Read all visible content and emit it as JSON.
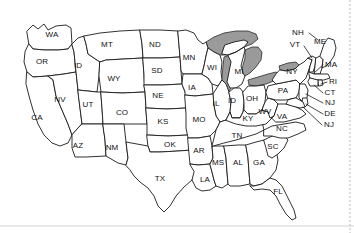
{
  "figure": {
    "width": 354,
    "height": 233,
    "background_color": "#ffffff",
    "outline_color": "#1a1a1a",
    "lake_fill_color": "#9a9a9a",
    "label_color": "#111111"
  },
  "map_data": {
    "type": "choropleth-outline",
    "projection": "albers-usa-like",
    "region": "contiguous United States",
    "state_count": 49,
    "features_shown": [
      "state outlines",
      "state abbreviation labels",
      "Great Lakes shaded gray",
      "leader lines for small northeastern states"
    ],
    "features_absent": [
      "Alaska",
      "Hawaii",
      "legend",
      "scale bar",
      "north arrow",
      "title text"
    ],
    "labels": [
      {
        "id": "WA",
        "text": "WA",
        "x": 52,
        "y": 35,
        "size": "normal"
      },
      {
        "id": "OR",
        "text": "OR",
        "x": 42,
        "y": 62,
        "size": "normal"
      },
      {
        "id": "ID",
        "text": "ID",
        "x": 78,
        "y": 66,
        "size": "normal"
      },
      {
        "id": "MT",
        "text": "MT",
        "x": 107,
        "y": 45,
        "size": "normal"
      },
      {
        "id": "WY",
        "text": "WY",
        "x": 114,
        "y": 79,
        "size": "normal"
      },
      {
        "id": "ND",
        "text": "ND",
        "x": 155,
        "y": 45,
        "size": "normal"
      },
      {
        "id": "SD",
        "text": "SD",
        "x": 157,
        "y": 71,
        "size": "normal"
      },
      {
        "id": "NE",
        "text": "NE",
        "x": 158,
        "y": 96,
        "size": "normal"
      },
      {
        "id": "KS",
        "text": "KS",
        "x": 163,
        "y": 122,
        "size": "normal"
      },
      {
        "id": "CA",
        "text": "CA",
        "x": 37,
        "y": 118,
        "size": "normal"
      },
      {
        "id": "NV",
        "text": "NV",
        "x": 60,
        "y": 100,
        "size": "normal"
      },
      {
        "id": "UT",
        "text": "UT",
        "x": 88,
        "y": 105,
        "size": "normal"
      },
      {
        "id": "CO",
        "text": "CO",
        "x": 122,
        "y": 113,
        "size": "normal"
      },
      {
        "id": "AZ",
        "text": "AZ",
        "x": 78,
        "y": 146,
        "size": "normal"
      },
      {
        "id": "NM",
        "text": "NM",
        "x": 112,
        "y": 148,
        "size": "normal"
      },
      {
        "id": "TX",
        "text": "TX",
        "x": 160,
        "y": 179,
        "size": "normal"
      },
      {
        "id": "OK",
        "text": "OK",
        "x": 170,
        "y": 145,
        "size": "normal"
      },
      {
        "id": "MN",
        "text": "MN",
        "x": 189,
        "y": 58,
        "size": "normal"
      },
      {
        "id": "IA",
        "text": "IA",
        "x": 192,
        "y": 88,
        "size": "normal"
      },
      {
        "id": "MO",
        "text": "MO",
        "x": 199,
        "y": 120,
        "size": "normal"
      },
      {
        "id": "AR",
        "text": "AR",
        "x": 199,
        "y": 151,
        "size": "normal"
      },
      {
        "id": "LA",
        "text": "LA",
        "x": 205,
        "y": 180,
        "size": "normal"
      },
      {
        "id": "WI",
        "text": "WI",
        "x": 212,
        "y": 68,
        "size": "normal"
      },
      {
        "id": "IL",
        "text": "IL",
        "x": 216,
        "y": 104,
        "size": "normal"
      },
      {
        "id": "MI",
        "text": "MI",
        "x": 239,
        "y": 72,
        "size": "normal"
      },
      {
        "id": "IN",
        "text": "ID",
        "x": 232,
        "y": 101,
        "size": "normal"
      },
      {
        "id": "OH",
        "text": "OH",
        "x": 252,
        "y": 99,
        "size": "normal"
      },
      {
        "id": "KY",
        "text": "KY",
        "x": 248,
        "y": 119,
        "size": "normal"
      },
      {
        "id": "TN",
        "text": "TN",
        "x": 237,
        "y": 136,
        "size": "normal"
      },
      {
        "id": "MS",
        "text": "MS",
        "x": 218,
        "y": 163,
        "size": "normal"
      },
      {
        "id": "AL",
        "text": "AL",
        "x": 238,
        "y": 163,
        "size": "normal"
      },
      {
        "id": "GA",
        "text": "GA",
        "x": 259,
        "y": 163,
        "size": "normal"
      },
      {
        "id": "FL",
        "text": "FL",
        "x": 278,
        "y": 192,
        "size": "normal"
      },
      {
        "id": "SC",
        "text": "SC",
        "x": 273,
        "y": 147,
        "size": "normal"
      },
      {
        "id": "NC",
        "text": "NC",
        "x": 282,
        "y": 129,
        "size": "normal"
      },
      {
        "id": "WV",
        "text": "WV",
        "x": 265,
        "y": 112,
        "size": "normal"
      },
      {
        "id": "VA",
        "text": "VA",
        "x": 282,
        "y": 117,
        "size": "normal"
      },
      {
        "id": "PA",
        "text": "PA",
        "x": 283,
        "y": 91,
        "size": "normal"
      },
      {
        "id": "NY",
        "text": "NY",
        "x": 292,
        "y": 72,
        "size": "normal"
      },
      {
        "id": "VT",
        "text": "VT",
        "x": 295,
        "y": 45,
        "size": "normal"
      },
      {
        "id": "NH",
        "text": "NH",
        "x": 298,
        "y": 33,
        "size": "normal"
      },
      {
        "id": "ME",
        "text": "ME",
        "x": 320,
        "y": 42,
        "size": "normal"
      },
      {
        "id": "MA",
        "text": "MA",
        "x": 331,
        "y": 65,
        "size": "normal"
      },
      {
        "id": "RI",
        "text": "RI",
        "x": 333,
        "y": 82,
        "size": "normal"
      },
      {
        "id": "CT",
        "text": "CT",
        "x": 330,
        "y": 93,
        "size": "normal"
      },
      {
        "id": "NJ",
        "text": "NJ",
        "x": 330,
        "y": 103,
        "size": "normal"
      },
      {
        "id": "DE",
        "text": "DE",
        "x": 330,
        "y": 114,
        "size": "normal"
      },
      {
        "id": "MD",
        "text": "NJ",
        "x": 329,
        "y": 125,
        "size": "normal"
      }
    ],
    "lakes": [
      "Lake Superior",
      "Lake Michigan",
      "Lake Huron",
      "Lake Erie",
      "Lake Ontario"
    ]
  }
}
